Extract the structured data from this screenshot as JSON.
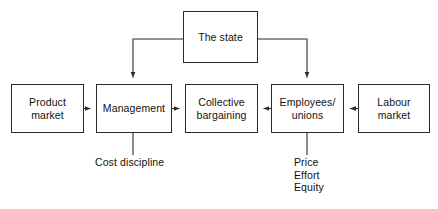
{
  "diagram": {
    "stroke_color": "#2b2b2b",
    "text_color": "#111111",
    "background_color": "#ffffff",
    "nodes": [
      {
        "id": "the-state",
        "label": "The state",
        "x": 183,
        "y": 11,
        "w": 75,
        "h": 52
      },
      {
        "id": "product-market",
        "label": "Product\nmarket",
        "x": 11,
        "y": 84,
        "w": 73,
        "h": 49
      },
      {
        "id": "management",
        "label": "Management",
        "x": 96,
        "y": 84,
        "w": 76,
        "h": 49
      },
      {
        "id": "collective-bargaining",
        "label": "Collective\nbargaining",
        "x": 185,
        "y": 84,
        "w": 73,
        "h": 49
      },
      {
        "id": "employees-unions",
        "label": "Employees/\nunions",
        "x": 271,
        "y": 84,
        "w": 73,
        "h": 49
      },
      {
        "id": "labour-market",
        "label": "Labour\nmarket",
        "x": 358,
        "y": 84,
        "w": 72,
        "h": 49
      }
    ],
    "annotations": [
      {
        "id": "cost-discipline",
        "label": "Cost discipline",
        "x": 95,
        "y": 156,
        "align": "left"
      },
      {
        "id": "price-effort-equity",
        "label": "Price\nEffort\nEquity",
        "x": 294,
        "y": 156,
        "align": "left"
      }
    ],
    "connectors": [
      {
        "id": "state-to-management",
        "from": "the-state",
        "to": "management",
        "kind": "elbow-down-left",
        "arrow": true
      },
      {
        "id": "state-to-employees-unions",
        "from": "the-state",
        "to": "employees-unions",
        "kind": "elbow-down-right",
        "arrow": true
      },
      {
        "id": "product-market-to-management",
        "from": "product-market",
        "to": "management",
        "kind": "horizontal-right",
        "arrow": true
      },
      {
        "id": "management-to-bargaining",
        "from": "management",
        "to": "collective-bargaining",
        "kind": "horizontal-right",
        "arrow": true
      },
      {
        "id": "employees-unions-to-bargaining",
        "from": "employees-unions",
        "to": "collective-bargaining",
        "kind": "horizontal-left",
        "arrow": true
      },
      {
        "id": "labour-market-to-employees",
        "from": "labour-market",
        "to": "employees-unions",
        "kind": "horizontal-left",
        "arrow": true
      },
      {
        "id": "management-to-cost-discipline",
        "from": "management",
        "to": "cost-discipline",
        "kind": "vertical-down",
        "arrow": false
      },
      {
        "id": "employees-to-price-effort",
        "from": "employees-unions",
        "to": "price-effort-equity",
        "kind": "vertical-down",
        "arrow": false
      }
    ]
  }
}
